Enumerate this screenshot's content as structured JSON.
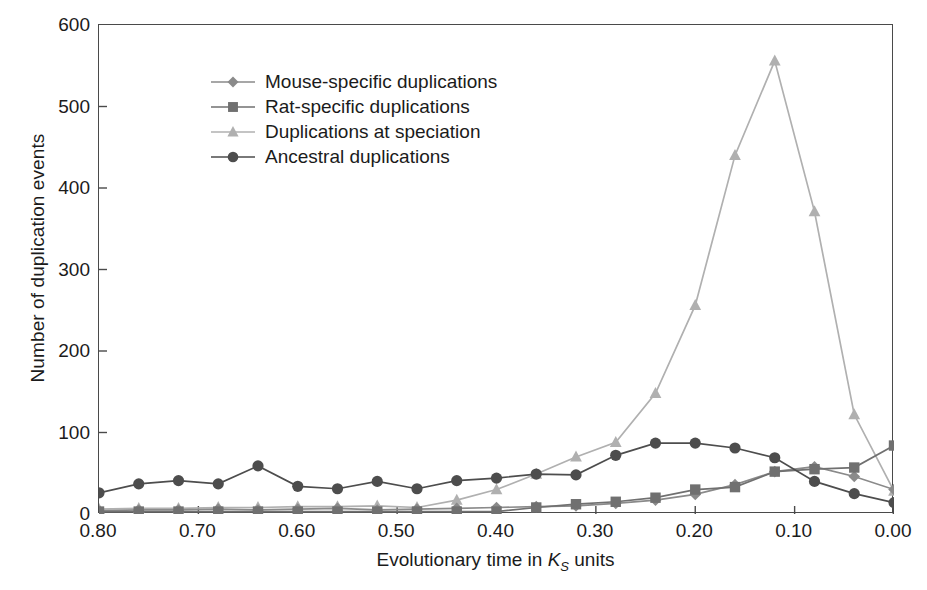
{
  "chart_data": {
    "type": "line",
    "title": "",
    "xlabel": "Evolutionary time in K_S units",
    "xlabel_prefix": "Evolutionary time in ",
    "xlabel_var": "K",
    "xlabel_sub": "S",
    "xlabel_suffix": " units",
    "ylabel": "Number of duplication events",
    "xlim": [
      0.8,
      0.0
    ],
    "ylim": [
      0,
      600
    ],
    "x_reversed": true,
    "grid": false,
    "legend_position": "top-left-inside",
    "xticks": [
      "0.80",
      "0.70",
      "0.60",
      "0.50",
      "0.40",
      "0.30",
      "0.20",
      "0.10",
      "0.00"
    ],
    "xtick_values": [
      0.8,
      0.7,
      0.6,
      0.5,
      0.4,
      0.3,
      0.2,
      0.1,
      0.0
    ],
    "yticks": [
      "0",
      "100",
      "200",
      "300",
      "400",
      "500",
      "600"
    ],
    "ytick_values": [
      0,
      100,
      200,
      300,
      400,
      500,
      600
    ],
    "x": [
      0.8,
      0.76,
      0.72,
      0.68,
      0.64,
      0.6,
      0.56,
      0.52,
      0.48,
      0.44,
      0.4,
      0.36,
      0.32,
      0.28,
      0.24,
      0.2,
      0.16,
      0.12,
      0.08,
      0.04,
      0.0
    ],
    "series": [
      {
        "name": "Mouse-specific duplications",
        "marker": "diamond",
        "color": "#8a8a8a",
        "values": [
          4,
          5,
          5,
          6,
          5,
          6,
          7,
          5,
          6,
          7,
          8,
          9,
          10,
          13,
          17,
          24,
          36,
          52,
          58,
          46,
          30
        ]
      },
      {
        "name": "Rat-specific duplications",
        "marker": "square",
        "color": "#707070",
        "values": [
          3,
          3,
          3,
          3,
          3,
          3,
          3,
          3,
          3,
          3,
          3,
          8,
          12,
          15,
          20,
          30,
          33,
          52,
          55,
          57,
          84
        ]
      },
      {
        "name": "Duplications at speciation",
        "marker": "triangle",
        "color": "#b0b0b0",
        "values": [
          6,
          7,
          7,
          8,
          8,
          9,
          9,
          10,
          8,
          17,
          30,
          49,
          70,
          88,
          148,
          256,
          440,
          556,
          371,
          122,
          28
        ]
      },
      {
        "name": "Ancestral duplications",
        "marker": "circle",
        "color": "#4d4d4d",
        "values": [
          26,
          37,
          41,
          37,
          59,
          34,
          31,
          40,
          31,
          41,
          44,
          49,
          48,
          72,
          87,
          87,
          81,
          69,
          40,
          25,
          14
        ]
      }
    ]
  },
  "legend": {
    "items": [
      {
        "label": "Mouse-specific duplications"
      },
      {
        "label": "Rat-specific duplications"
      },
      {
        "label": "Duplications at speciation"
      },
      {
        "label": "Ancestral duplications"
      }
    ]
  }
}
